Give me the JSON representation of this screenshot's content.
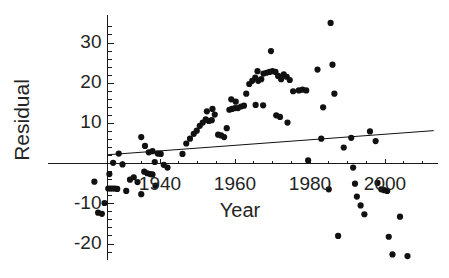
{
  "chart_data": {
    "type": "scatter",
    "title": "",
    "xlabel": "Year",
    "ylabel": "Residual",
    "xlim": [
      1922,
      2014
    ],
    "ylim": [
      -24,
      37
    ],
    "grid": false,
    "legend": null,
    "xticks": [
      1940,
      1960,
      1980,
      2000
    ],
    "xtick_labels": [
      "1940",
      "1960",
      "1980",
      "2000"
    ],
    "yticks": [
      -20,
      -10,
      10,
      20,
      30
    ],
    "ytick_labels": [
      "-20",
      "-10",
      "10",
      "20",
      "30"
    ],
    "y_minor_tick_step": 2,
    "x_minor_tick_step": 5,
    "axis_origin": {
      "x": 1926,
      "y": 0
    },
    "marker": {
      "shape": "circle",
      "color": "#111111",
      "size_px": 5
    },
    "trend_line": {
      "type": "linear-regression",
      "color": "#111111",
      "width_px": 1,
      "x_start": 1926,
      "y_start": 2.2,
      "x_end": 2013,
      "y_end": 8.2
    },
    "points": [
      {
        "x": 1922.5,
        "y": -4.5
      },
      {
        "x": 1923.5,
        "y": -12.2
      },
      {
        "x": 1924.5,
        "y": -12.5
      },
      {
        "x": 1925.2,
        "y": -9.8
      },
      {
        "x": 1926.2,
        "y": -6.2
      },
      {
        "x": 1926.8,
        "y": -6.2
      },
      {
        "x": 1927.4,
        "y": -6.2
      },
      {
        "x": 1928.0,
        "y": -6.2
      },
      {
        "x": 1928.6,
        "y": -6.3
      },
      {
        "x": 1926.5,
        "y": -2.6
      },
      {
        "x": 1927.5,
        "y": 0.2
      },
      {
        "x": 1929.0,
        "y": 2.5
      },
      {
        "x": 1930.0,
        "y": -0.2
      },
      {
        "x": 1931.0,
        "y": -6.8
      },
      {
        "x": 1932.0,
        "y": -4.0
      },
      {
        "x": 1933.0,
        "y": -3.4
      },
      {
        "x": 1934.0,
        "y": -4.6
      },
      {
        "x": 1935.0,
        "y": -7.6
      },
      {
        "x": 1935.8,
        "y": -2.0
      },
      {
        "x": 1936.6,
        "y": -2.4
      },
      {
        "x": 1937.4,
        "y": -2.6
      },
      {
        "x": 1938.0,
        "y": -2.7
      },
      {
        "x": 1938.8,
        "y": -5.5
      },
      {
        "x": 1935.0,
        "y": 6.6
      },
      {
        "x": 1936.0,
        "y": 4.4
      },
      {
        "x": 1937.0,
        "y": 2.8
      },
      {
        "x": 1938.0,
        "y": 3.1
      },
      {
        "x": 1938.6,
        "y": 0.4
      },
      {
        "x": 1939.4,
        "y": 2.5
      },
      {
        "x": 1940.2,
        "y": 2.4
      },
      {
        "x": 1941.0,
        "y": -0.3
      },
      {
        "x": 1942.0,
        "y": -1.0
      },
      {
        "x": 1946.0,
        "y": 2.4
      },
      {
        "x": 1947.0,
        "y": 5.0
      },
      {
        "x": 1948.0,
        "y": 6.2
      },
      {
        "x": 1949.0,
        "y": 7.4
      },
      {
        "x": 1949.8,
        "y": 8.2
      },
      {
        "x": 1950.6,
        "y": 9.4
      },
      {
        "x": 1951.4,
        "y": 10.2
      },
      {
        "x": 1952.2,
        "y": 11.0
      },
      {
        "x": 1953.0,
        "y": 10.6
      },
      {
        "x": 1953.8,
        "y": 10.8
      },
      {
        "x": 1954.6,
        "y": 12.2
      },
      {
        "x": 1952.5,
        "y": 13.0
      },
      {
        "x": 1954.0,
        "y": 13.6
      },
      {
        "x": 1955.5,
        "y": 7.2
      },
      {
        "x": 1956.3,
        "y": 7.0
      },
      {
        "x": 1957.1,
        "y": 6.6
      },
      {
        "x": 1957.8,
        "y": 8.8
      },
      {
        "x": 1958.5,
        "y": 13.4
      },
      {
        "x": 1959.2,
        "y": 13.6
      },
      {
        "x": 1960.0,
        "y": 13.8
      },
      {
        "x": 1960.8,
        "y": 13.8
      },
      {
        "x": 1961.6,
        "y": 14.2
      },
      {
        "x": 1962.4,
        "y": 14.4
      },
      {
        "x": 1959.0,
        "y": 16.0
      },
      {
        "x": 1960.2,
        "y": 15.4
      },
      {
        "x": 1963.0,
        "y": 17.4
      },
      {
        "x": 1963.8,
        "y": 19.8
      },
      {
        "x": 1964.6,
        "y": 20.6
      },
      {
        "x": 1965.4,
        "y": 21.4
      },
      {
        "x": 1966.2,
        "y": 20.6
      },
      {
        "x": 1967.0,
        "y": 21.0
      },
      {
        "x": 1966.0,
        "y": 23.0
      },
      {
        "x": 1967.6,
        "y": 22.4
      },
      {
        "x": 1968.4,
        "y": 22.6
      },
      {
        "x": 1969.2,
        "y": 22.8
      },
      {
        "x": 1970.0,
        "y": 23.0
      },
      {
        "x": 1970.8,
        "y": 22.8
      },
      {
        "x": 1969.6,
        "y": 28.0
      },
      {
        "x": 1965.5,
        "y": 14.6
      },
      {
        "x": 1967.5,
        "y": 14.5
      },
      {
        "x": 1971.5,
        "y": 21.8
      },
      {
        "x": 1972.3,
        "y": 21.0
      },
      {
        "x": 1973.0,
        "y": 22.2
      },
      {
        "x": 1973.8,
        "y": 21.6
      },
      {
        "x": 1974.6,
        "y": 20.8
      },
      {
        "x": 1971.0,
        "y": 12.0
      },
      {
        "x": 1972.0,
        "y": 11.6
      },
      {
        "x": 1974.0,
        "y": 10.2
      },
      {
        "x": 1975.5,
        "y": 18.0
      },
      {
        "x": 1977.0,
        "y": 18.2
      },
      {
        "x": 1978.0,
        "y": 18.4
      },
      {
        "x": 1979.0,
        "y": 18.2
      },
      {
        "x": 1979.5,
        "y": 0.8
      },
      {
        "x": 1982.0,
        "y": 23.4
      },
      {
        "x": 1983.5,
        "y": 14.0
      },
      {
        "x": 1983.0,
        "y": 6.2
      },
      {
        "x": 1985.5,
        "y": 35.0
      },
      {
        "x": 1986.0,
        "y": 24.6
      },
      {
        "x": 1986.5,
        "y": 17.4
      },
      {
        "x": 1985.0,
        "y": -6.4
      },
      {
        "x": 1987.5,
        "y": -18.0
      },
      {
        "x": 1989.0,
        "y": 4.0
      },
      {
        "x": 1991.0,
        "y": 6.4
      },
      {
        "x": 1991.5,
        "y": -1.0
      },
      {
        "x": 1992.0,
        "y": -5.0
      },
      {
        "x": 1992.5,
        "y": -8.2
      },
      {
        "x": 1993.5,
        "y": -10.4
      },
      {
        "x": 1994.5,
        "y": -12.6
      },
      {
        "x": 1996.0,
        "y": 8.0
      },
      {
        "x": 1997.5,
        "y": 5.6
      },
      {
        "x": 1998.0,
        "y": -4.8
      },
      {
        "x": 1999.0,
        "y": -6.4
      },
      {
        "x": 1999.8,
        "y": -6.6
      },
      {
        "x": 2000.6,
        "y": -6.8
      },
      {
        "x": 2001.0,
        "y": -18.2
      },
      {
        "x": 2002.0,
        "y": -22.6
      },
      {
        "x": 2004.0,
        "y": -13.2
      },
      {
        "x": 2006.0,
        "y": -23.0
      }
    ]
  },
  "axes": {
    "ylabel_text": "Residual",
    "xlabel_text": "Year"
  }
}
